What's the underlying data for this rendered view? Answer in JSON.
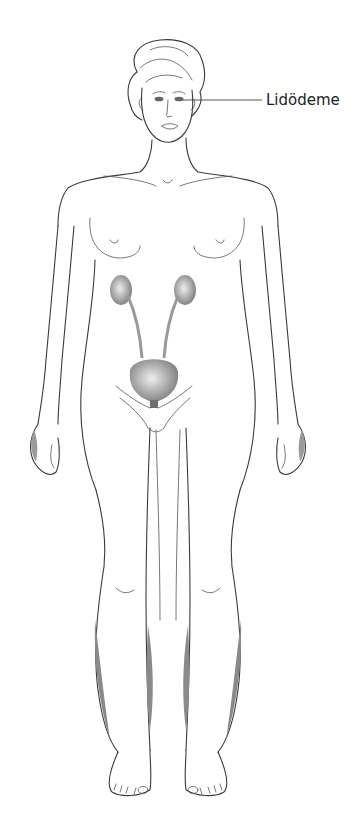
{
  "diagram": {
    "type": "anatomical-illustration",
    "labels": [
      {
        "text": "Lidödeme",
        "target": "eyes",
        "leader_line": true
      }
    ],
    "highlighted_organs": [
      "left-kidney",
      "right-kidney",
      "ureters",
      "bladder"
    ],
    "shaded_regions": [
      "left-lower-leg-outer",
      "left-lower-leg-inner",
      "right-lower-leg-inner",
      "right-lower-leg-outer"
    ],
    "colors": {
      "organ_fill": "#8c8c8c",
      "organ_highlight": "#e6e6e6",
      "edema_shade": "#8a8a8a",
      "outline": "#3a3a3a",
      "background": "#ffffff"
    }
  }
}
